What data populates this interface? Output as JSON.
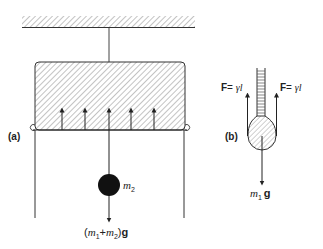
{
  "figure": {
    "panel_a": {
      "label": "(a)",
      "mass_label_m": "m",
      "mass_label_sub": "2",
      "weight_label": {
        "open": "(",
        "m1": "m",
        "sub1": "1",
        "plus": "+",
        "m2": "m",
        "sub2": "2",
        "close": ")",
        "g": "g"
      },
      "upward_force_arrow_count": 5
    },
    "panel_b": {
      "label": "(b)",
      "force_left": {
        "F": "F",
        "eq": "= ",
        "gamma": "γ",
        "l": "l"
      },
      "force_right": {
        "F": "F",
        "eq": "= ",
        "gamma": "γ",
        "l": "l"
      },
      "weight_label": {
        "m": "m",
        "sub": "1",
        "g": "g"
      }
    },
    "colors": {
      "ink": "#222222",
      "hatch": "#777777",
      "background": "#ffffff"
    }
  }
}
